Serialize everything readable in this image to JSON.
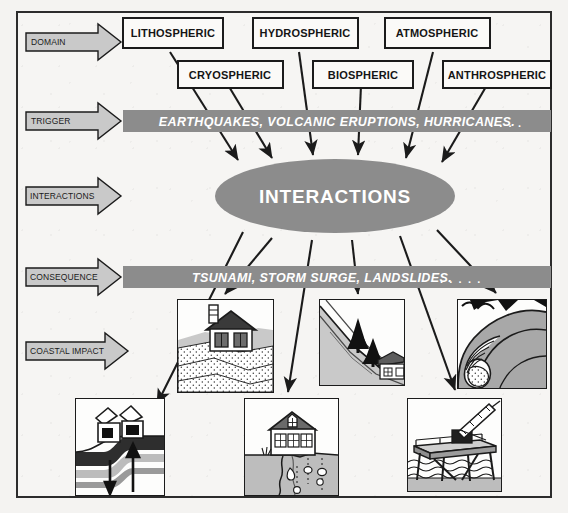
{
  "diagram": {
    "row_labels": [
      {
        "id": "domain",
        "label": "DOMAIN"
      },
      {
        "id": "trigger",
        "label": "TRIGGER"
      },
      {
        "id": "interactions",
        "label": "INTERACTIONS"
      },
      {
        "id": "consequence",
        "label": "CONSEQUENCE"
      },
      {
        "id": "coastal-impact",
        "label": "COASTAL IMPACT"
      }
    ],
    "domains": [
      {
        "id": "lithospheric",
        "label": "LITHOSPHERIC"
      },
      {
        "id": "hydrospheric",
        "label": "HYDROSPHERIC"
      },
      {
        "id": "atmospheric",
        "label": "ATMOSPHERIC"
      },
      {
        "id": "cryospheric",
        "label": "CRYOSPHERIC"
      },
      {
        "id": "biospheric",
        "label": "BIOSPHERIC"
      },
      {
        "id": "anthrospheric",
        "label": "ANTHROSPHERIC"
      }
    ],
    "trigger_band": {
      "text": "EARTHQUAKES, VOLCANIC ERUPTIONS, HURRICANES.",
      "ellipsis": ". . . ."
    },
    "hub": {
      "label": "INTERACTIONS"
    },
    "consequence_band": {
      "text": "TSUNAMI, STORM SURGE, LANDSLIDES.",
      "ellipsis": ". . . . ."
    },
    "impacts": [
      {
        "id": "bluff-erosion-house",
        "caption": "house on eroding bluff"
      },
      {
        "id": "landslide-trees-house",
        "caption": "landslide with trees above house"
      },
      {
        "id": "breaking-wave",
        "caption": "breaking wave"
      },
      {
        "id": "fault-rupture-house",
        "caption": "fault rupture offsetting ground under broken house"
      },
      {
        "id": "cliff-collapse-house",
        "caption": "house at collapsing cliff edge"
      },
      {
        "id": "pier-crane",
        "caption": "pier with crane over water"
      }
    ],
    "colors": {
      "band_gray": "#8c8c8c",
      "ellipse_gray": "#8c8c8c",
      "tag_gray": "#c9c9c9",
      "ink": "#1b1b1b",
      "paper": "#f6f5f3",
      "mid_gray": "#9a9a9a",
      "light_gray": "#cfcfcf"
    }
  }
}
